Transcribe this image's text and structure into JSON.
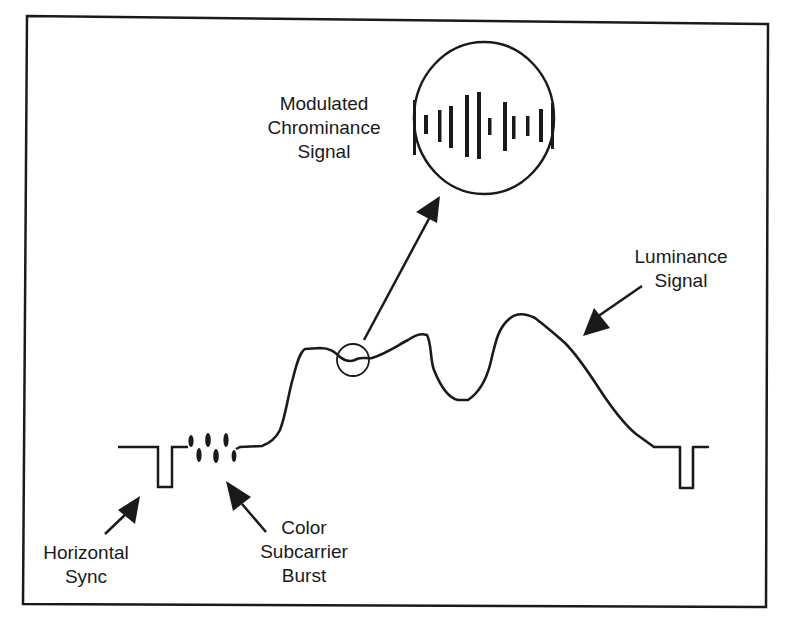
{
  "diagram": {
    "labels": {
      "chrominance": {
        "line1": "Modulated",
        "line2": "Chrominance",
        "line3": "Signal"
      },
      "luminance": {
        "line1": "Luminance",
        "line2": "Signal"
      },
      "horizontal_sync": {
        "line1": "Horizontal",
        "line2": "Sync"
      },
      "color_burst": {
        "line1": "Color",
        "line2": "Subcarrier",
        "line3": "Burst"
      }
    },
    "components": [
      {
        "id": "horizontal-sync",
        "label": "Horizontal Sync",
        "shape": "rectangular negative pulse"
      },
      {
        "id": "color-burst",
        "label": "Color Subcarrier Burst",
        "shape": "short sinusoidal burst"
      },
      {
        "id": "luminance",
        "label": "Luminance Signal",
        "shape": "varying waveform"
      },
      {
        "id": "chrominance",
        "label": "Modulated Chrominance Signal",
        "shape": "magnified inset of amplitude-modulated bars"
      }
    ],
    "colors": {
      "stroke": "#1a1a1a",
      "background": "#ffffff"
    }
  }
}
